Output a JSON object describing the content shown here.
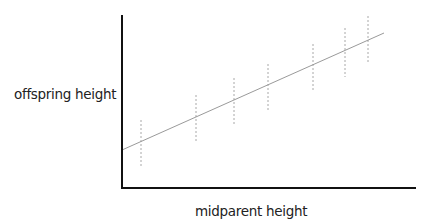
{
  "chart_data": {
    "type": "scatter",
    "title": "",
    "xlabel": "midparent height",
    "ylabel": "offspring height",
    "grid": false,
    "legend": null,
    "axis_ranges": {
      "x": [
        0,
        1
      ],
      "y": [
        0,
        1
      ]
    },
    "regression_line": {
      "x": [
        0.0,
        0.89
      ],
      "y": [
        0.22,
        0.89
      ]
    },
    "error_bars": [
      {
        "x": 0.065,
        "y_center": 0.34,
        "y_low": 0.13,
        "y_high": 0.4
      },
      {
        "x": 0.255,
        "y_center": 0.45,
        "y_low": 0.26,
        "y_high": 0.55
      },
      {
        "x": 0.385,
        "y_center": 0.52,
        "y_low": 0.36,
        "y_high": 0.64
      },
      {
        "x": 0.5,
        "y_center": 0.59,
        "y_low": 0.44,
        "y_high": 0.73
      },
      {
        "x": 0.65,
        "y_center": 0.67,
        "y_low": 0.56,
        "y_high": 0.83
      },
      {
        "x": 0.76,
        "y_center": 0.74,
        "y_low": 0.64,
        "y_high": 0.93
      },
      {
        "x": 0.84,
        "y_center": 0.78,
        "y_low": 0.72,
        "y_high": 1.0
      }
    ]
  },
  "labels": {
    "x_axis": "midparent height",
    "y_axis": "offspring height"
  },
  "plot_px": {
    "origin": [
      122,
      188
    ],
    "x_end": 416,
    "y_top": 15,
    "line": {
      "x1": 122,
      "y1": 150,
      "x2": 384,
      "y2": 33
    },
    "bars": [
      {
        "x": 141,
        "y1": 120,
        "y2": 166
      },
      {
        "x": 196,
        "y1": 95,
        "y2": 143
      },
      {
        "x": 234,
        "y1": 78,
        "y2": 125
      },
      {
        "x": 268,
        "y1": 64,
        "y2": 111
      },
      {
        "x": 313,
        "y1": 44,
        "y2": 92
      },
      {
        "x": 345,
        "y1": 28,
        "y2": 77
      },
      {
        "x": 368,
        "y1": 16,
        "y2": 63
      }
    ]
  }
}
